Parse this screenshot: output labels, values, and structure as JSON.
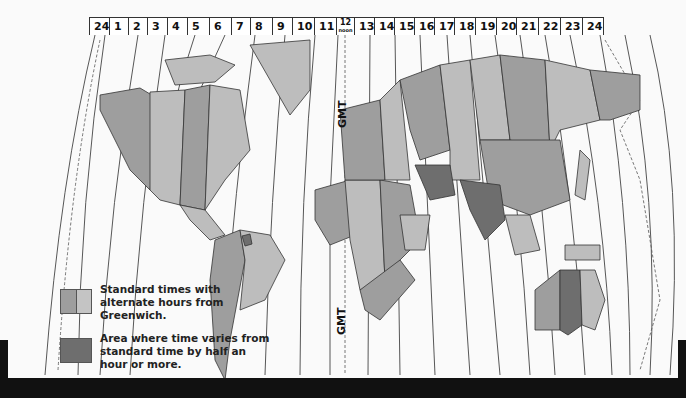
{
  "map": {
    "title": "World Time Zones",
    "hour_labels": [
      "24",
      "1",
      "2",
      "3",
      "4",
      "5",
      "6",
      "7",
      "8",
      "9",
      "10",
      "11",
      "12",
      "13",
      "14",
      "15",
      "16",
      "17",
      "18",
      "19",
      "20",
      "21",
      "22",
      "23",
      "24"
    ],
    "noon_label": "noon",
    "meridian_label": "GMT",
    "colors": {
      "background": "#fafafa",
      "land_light": "#bdbdbd",
      "land_mid": "#9e9e9e",
      "land_dark": "#6e6e6e",
      "outline": "#333333"
    }
  },
  "legend": {
    "items": [
      {
        "label": "Standard times with alternate hours from Greenwich.",
        "swatch": "split-light-mid"
      },
      {
        "label": "Area where time varies from standard time by half an hour or more.",
        "swatch": "dark"
      }
    ]
  }
}
